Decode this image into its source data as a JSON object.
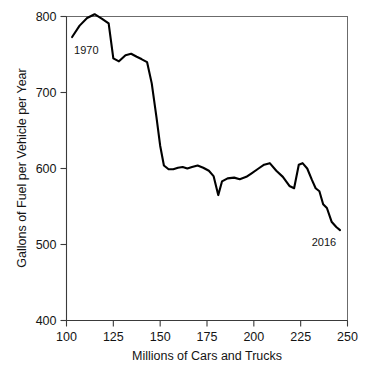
{
  "chart_data": {
    "type": "line",
    "title": "",
    "xlabel": "Millions of Cars and Trucks",
    "ylabel": "Gallons of Fuel per Vehicle per Year",
    "xlim": [
      100,
      250
    ],
    "ylim": [
      400,
      800
    ],
    "xticks": [
      100,
      125,
      150,
      175,
      200,
      225,
      250
    ],
    "yticks": [
      400,
      500,
      600,
      700,
      800
    ],
    "grid": false,
    "legend": "none",
    "annotations": [
      {
        "label": "1970",
        "x": 103,
        "y": 773
      },
      {
        "label": "2016",
        "x": 245,
        "y": 519
      }
    ],
    "series": [
      {
        "name": "Fuel use per vehicle",
        "x": [
          103.0,
          107.0,
          111.0,
          115.0,
          119.0,
          122.5,
          125.0,
          128.0,
          131.5,
          134.5,
          137.5,
          140.0,
          143.0,
          145.5,
          148.0,
          150.0,
          152.0,
          154.5,
          157.0,
          159.5,
          162.0,
          164.5,
          167.0,
          170.0,
          173.0,
          176.0,
          178.5,
          181.0,
          183.0,
          186.0,
          189.5,
          192.5,
          196.0,
          199.0,
          202.5,
          205.5,
          208.5,
          212.0,
          215.5,
          219.0,
          221.5,
          224.0,
          226.0,
          228.5,
          231.0,
          233.0,
          235.0,
          237.0,
          239.0,
          241.5,
          244.0,
          246.0
        ],
        "y": [
          773.0,
          788.0,
          798.0,
          803.0,
          797.0,
          791.0,
          745.0,
          741.0,
          749.0,
          751.0,
          747.0,
          744.0,
          740.0,
          712.0,
          668.0,
          630.0,
          604.0,
          599.0,
          599.0,
          601.0,
          602.0,
          600.0,
          602.0,
          604.0,
          601.0,
          597.0,
          590.0,
          565.0,
          583.0,
          587.0,
          588.0,
          586.0,
          589.0,
          594.0,
          600.0,
          605.0,
          607.0,
          597.0,
          589.0,
          577.0,
          574.0,
          605.0,
          607.0,
          600.0,
          585.0,
          574.0,
          570.0,
          553.0,
          548.0,
          530.0,
          523.0,
          519.0
        ]
      }
    ]
  }
}
